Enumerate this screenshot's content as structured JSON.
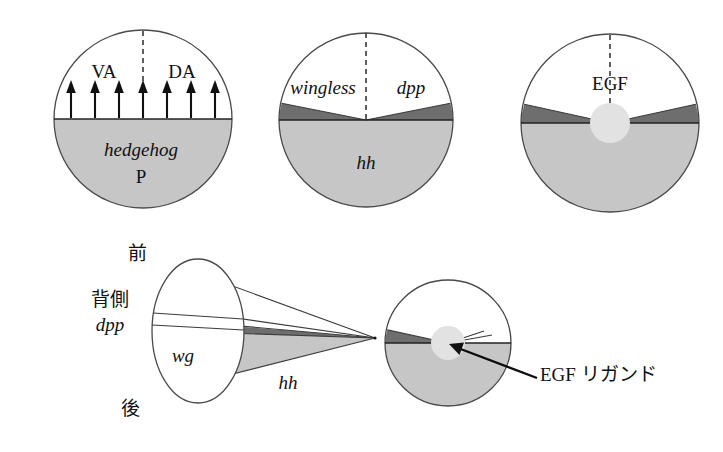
{
  "figure": {
    "background_color": "#ffffff",
    "width": 723,
    "height": 452
  },
  "palette": {
    "outline": "#4a4a4a",
    "light_gray": "#c6c6c6",
    "dark_gray": "#6e6e6e",
    "white": "#ffffff",
    "blob": "#e2e2e2",
    "text": "#111111"
  },
  "panels": [
    {
      "id": "panel-1",
      "name": "hedgehog-posterior-disc",
      "labels": {
        "ventral_anterior": "VA",
        "dorsal_anterior": "DA",
        "posterior_gene": "hedgehog",
        "posterior_compartment": "P"
      },
      "arrow_count": 7,
      "has_dashed_midline": true
    },
    {
      "id": "panel-2",
      "name": "wingless-dpp-hh-disc",
      "labels": {
        "left_domain": "wingless",
        "right_domain": "dpp",
        "bottom_domain": "hh"
      },
      "has_dashed_midline": true
    },
    {
      "id": "panel-3",
      "name": "egf-disc",
      "labels": {
        "center_domain": "EGF"
      },
      "has_dashed_midline": true,
      "has_center_blob": true
    },
    {
      "id": "panel-4",
      "name": "cone-projection-diagram",
      "labels": {
        "anterior": "前",
        "dorsal": "背側",
        "dpp": "dpp",
        "wingless": "wg",
        "posterior": "後",
        "hedgehog": "hh"
      }
    },
    {
      "id": "panel-5",
      "name": "egf-ligand-disc",
      "labels": {
        "callout": "EGF リガンド"
      },
      "has_center_blob": true,
      "has_callout_arrow": true
    }
  ]
}
